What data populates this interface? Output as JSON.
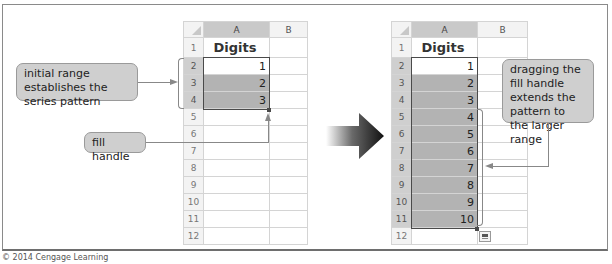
{
  "credit": "© 2014 Cengage Learning",
  "left_sheet": {
    "columns": [
      "A",
      "B"
    ],
    "rows": [
      {
        "num": "1",
        "A": "Digits",
        "B": ""
      },
      {
        "num": "2",
        "A": "1",
        "B": ""
      },
      {
        "num": "3",
        "A": "2",
        "B": ""
      },
      {
        "num": "4",
        "A": "3",
        "B": ""
      },
      {
        "num": "5",
        "A": "",
        "B": ""
      },
      {
        "num": "6",
        "A": "",
        "B": ""
      },
      {
        "num": "7",
        "A": "",
        "B": ""
      },
      {
        "num": "8",
        "A": "",
        "B": ""
      },
      {
        "num": "9",
        "A": "",
        "B": ""
      },
      {
        "num": "10",
        "A": "",
        "B": ""
      },
      {
        "num": "11",
        "A": "",
        "B": ""
      },
      {
        "num": "12",
        "A": "",
        "B": ""
      }
    ],
    "selected_range": "A2:A4"
  },
  "right_sheet": {
    "columns": [
      "A",
      "B"
    ],
    "rows": [
      {
        "num": "1",
        "A": "Digits",
        "B": ""
      },
      {
        "num": "2",
        "A": "1",
        "B": ""
      },
      {
        "num": "3",
        "A": "2",
        "B": ""
      },
      {
        "num": "4",
        "A": "3",
        "B": ""
      },
      {
        "num": "5",
        "A": "4",
        "B": ""
      },
      {
        "num": "6",
        "A": "5",
        "B": ""
      },
      {
        "num": "7",
        "A": "6",
        "B": ""
      },
      {
        "num": "8",
        "A": "7",
        "B": ""
      },
      {
        "num": "9",
        "A": "8",
        "B": ""
      },
      {
        "num": "10",
        "A": "9",
        "B": ""
      },
      {
        "num": "11",
        "A": "10",
        "B": ""
      },
      {
        "num": "12",
        "A": "",
        "B": ""
      }
    ],
    "selected_range": "A2:A11"
  },
  "callouts": {
    "initial_range": "initial range establishes the series pattern",
    "fill_handle": "fill handle",
    "dragging": "dragging the fill handle extends the pattern to the larger range"
  },
  "icons": {
    "transition_arrow": "arrow-right-icon",
    "autofill_options": "auto-fill-options-icon"
  },
  "colors": {
    "selection_fill": "#b3b3b3",
    "callout_fill": "#cfcfcf",
    "header_fill": "#f3f3f3"
  }
}
